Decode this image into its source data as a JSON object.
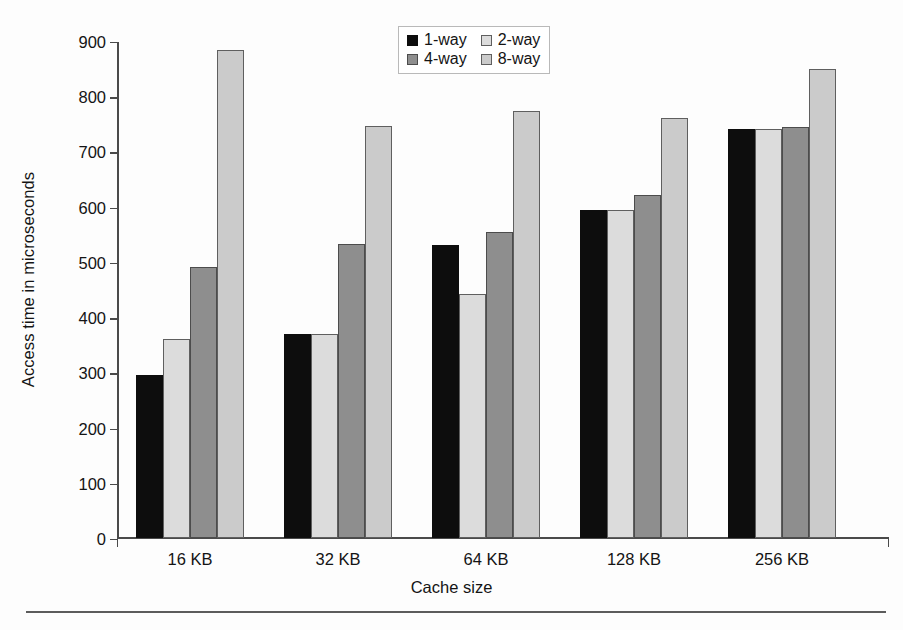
{
  "chart_data": {
    "type": "bar",
    "title": "",
    "xlabel": "Cache size",
    "ylabel": "Access time in microseconds",
    "categories": [
      "16 KB",
      "32 KB",
      "64 KB",
      "128 KB",
      "256 KB"
    ],
    "series": [
      {
        "name": "1-way",
        "color": "#0d0d0d",
        "values": [
          295,
          369,
          531,
          594,
          740
        ]
      },
      {
        "name": "2-way",
        "color": "#dcdcdc",
        "values": [
          360,
          369,
          441,
          594,
          740
        ]
      },
      {
        "name": "4-way",
        "color": "#8e8e8e",
        "values": [
          491,
          532,
          554,
          621,
          744
        ]
      },
      {
        "name": "8-way",
        "color": "#cbcbcb",
        "values": [
          883,
          746,
          774,
          761,
          849
        ]
      }
    ],
    "ylim": [
      0,
      900
    ],
    "y_ticks": [
      0,
      100,
      200,
      300,
      400,
      500,
      600,
      700,
      800,
      900
    ],
    "y_tick_labels": [
      "0",
      "100",
      "200",
      "300",
      "400",
      "500",
      "600",
      "700",
      "800",
      "900"
    ],
    "grid": false,
    "legend_position": "top-center"
  }
}
